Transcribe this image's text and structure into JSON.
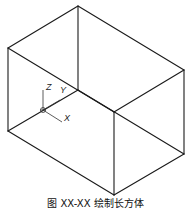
{
  "figure": {
    "caption": "图 XX-XX 绘制长方体",
    "stroke_color": "#1a1a1a",
    "box": {
      "vertices": {
        "top_left": [
          8,
          48
        ],
        "top_back": [
          78,
          6
        ],
        "top_right": [
          184,
          70
        ],
        "top_front": [
          114,
          112
        ],
        "bottom_left": [
          8,
          131
        ],
        "inner_back": [
          78,
          90
        ],
        "bottom_right": [
          184,
          154
        ],
        "bottom_front": [
          114,
          195
        ]
      }
    },
    "ucs": {
      "origin": [
        43,
        110
      ],
      "labels": {
        "z": "Z",
        "y": "Y",
        "x": "X"
      }
    }
  }
}
